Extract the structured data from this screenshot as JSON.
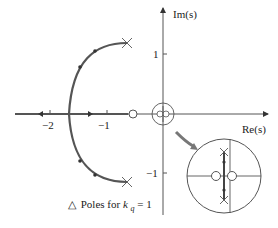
{
  "diagram": {
    "type": "root-locus",
    "axes": {
      "x_label": "Re(s)",
      "y_label": "Im(s)",
      "x_ticks": [
        "−2",
        "−1"
      ],
      "y_ticks": [
        "1",
        "−1"
      ]
    },
    "poles": [
      {
        "re": -0.65,
        "im": 1.18
      },
      {
        "re": -0.65,
        "im": -1.18
      }
    ],
    "zeros": [
      {
        "re": -0.53,
        "im": 0
      }
    ],
    "break_in_point": {
      "re": -1.68,
      "im": 0
    },
    "inset": {
      "description": "magnified view of locus near origin",
      "contents": "two zeros straddling imaginary axis, two poles on vertical locus"
    },
    "legend": {
      "symbol": "△",
      "text_prefix": "Poles for ",
      "variable": "k",
      "subscript": "q",
      "text_suffix": " = 1"
    }
  }
}
